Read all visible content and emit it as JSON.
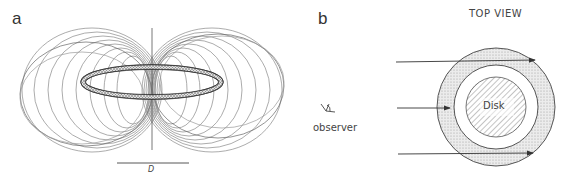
{
  "panel_a": {
    "label": "a",
    "scale_bar_label": "D"
  },
  "panel_b": {
    "label": "b",
    "title": "TOP VIEW",
    "observer_label": "observer",
    "disk_label": "Disk"
  },
  "colors": {
    "line": "#444444",
    "field_line": "#777777",
    "stipple": "#d6d6d6",
    "hatch": "#9a9a9a"
  }
}
